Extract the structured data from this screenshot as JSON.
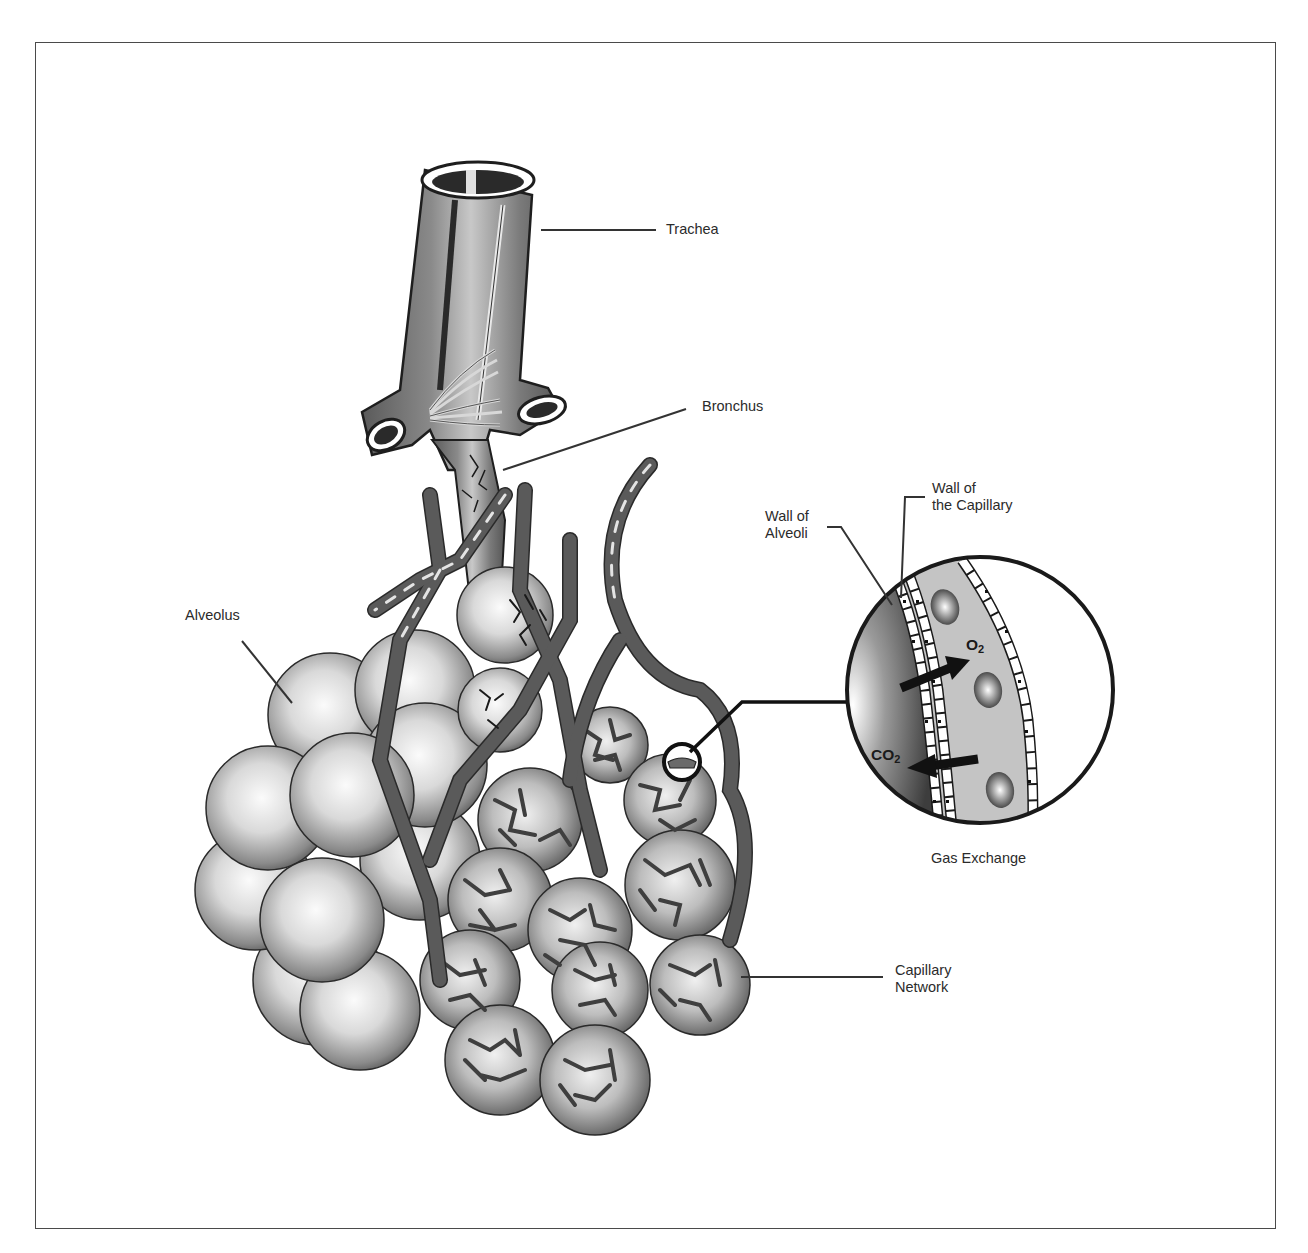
{
  "figure": {
    "palette": {
      "frame": "#4a4a4a",
      "vessel": "#4d4d4d",
      "vessel_outline": "#2a2a2a",
      "sphere_light": "#f4f4f4",
      "sphere_dark": "#6e6e6e",
      "label_text": "#2b2b2b",
      "leader_line": "#333333"
    }
  },
  "labels": {
    "trachea": "Trachea",
    "bronchus": "Bronchus",
    "alveolus": "Alveolus",
    "wall_of_alveoli_line1": "Wall of",
    "wall_of_alveoli_line2": "Alveoli",
    "wall_of_capillary_line1": "Wall of",
    "wall_of_capillary_line2": "the Capillary",
    "capillary_network_line1": "Capillary",
    "capillary_network_line2": "Network",
    "gas_exchange": "Gas Exchange"
  },
  "gases": {
    "oxygen_symbol": "O",
    "oxygen_subscript": "2",
    "carbon_dioxide_symbol": "CO",
    "carbon_dioxide_subscript": "2"
  }
}
